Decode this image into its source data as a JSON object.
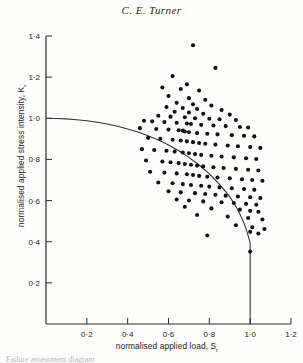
{
  "page": {
    "running_head": "C. E. Turner",
    "footer_fragment": "Failure assessment diagram"
  },
  "axis_labels": {
    "y_main": "normalised applied stress intensity, K",
    "y_sub": "r",
    "x_main": "normalised applied load, S",
    "x_sub": "r"
  },
  "chart_data": {
    "type": "scatter",
    "title": "C. E. Turner",
    "xlabel": "normalised applied load, Sr",
    "ylabel": "normalised applied stress intensity, Kr",
    "xlim": [
      0,
      1.2
    ],
    "ylim": [
      0,
      1.4
    ],
    "xticks": [
      0.2,
      0.4,
      0.6,
      0.8,
      1.0,
      1.2
    ],
    "xtick_labels": [
      "0·2",
      "0·4",
      "0·6",
      "0·8",
      "1·0",
      "1·2"
    ],
    "yticks": [
      0.2,
      0.4,
      0.6,
      0.8,
      1.0,
      1.2,
      1.4
    ],
    "ytick_labels": [
      "0·2",
      "0·4",
      "0·6",
      "0·8",
      "1·0",
      "1·2",
      "1·4"
    ],
    "grid": false,
    "legend": null,
    "marker": "filled-circle",
    "marker_color": "#111111",
    "curve_color": "#333333",
    "series": [
      {
        "name": "failure assessment curve",
        "type": "line",
        "cutoff_sr": 1.0,
        "points": [
          [
            0.0,
            1.0
          ],
          [
            0.05,
            0.999
          ],
          [
            0.1,
            0.997
          ],
          [
            0.15,
            0.993
          ],
          [
            0.2,
            0.988
          ],
          [
            0.25,
            0.981
          ],
          [
            0.3,
            0.972
          ],
          [
            0.35,
            0.961
          ],
          [
            0.4,
            0.948
          ],
          [
            0.45,
            0.933
          ],
          [
            0.5,
            0.915
          ],
          [
            0.55,
            0.894
          ],
          [
            0.6,
            0.87
          ],
          [
            0.65,
            0.842
          ],
          [
            0.7,
            0.81
          ],
          [
            0.75,
            0.773
          ],
          [
            0.8,
            0.73
          ],
          [
            0.85,
            0.679
          ],
          [
            0.88,
            0.644
          ],
          [
            0.9,
            0.618
          ],
          [
            0.92,
            0.588
          ],
          [
            0.94,
            0.554
          ],
          [
            0.96,
            0.513
          ],
          [
            0.97,
            0.489
          ],
          [
            0.98,
            0.462
          ],
          [
            0.99,
            0.43
          ],
          [
            1.0,
            0.392
          ]
        ],
        "vertical_cutoff": {
          "sr": 1.0,
          "kr_from": 0.392,
          "kr_to": 0.0
        }
      },
      {
        "name": "test data",
        "type": "scatter",
        "points": [
          [
            0.72,
            1.355
          ],
          [
            0.83,
            1.245
          ],
          [
            0.62,
            1.205
          ],
          [
            0.69,
            1.165
          ],
          [
            0.57,
            1.15
          ],
          [
            0.66,
            1.142
          ],
          [
            0.75,
            1.135
          ],
          [
            0.6,
            1.108
          ],
          [
            0.7,
            1.098
          ],
          [
            0.78,
            1.09
          ],
          [
            0.64,
            1.075
          ],
          [
            0.72,
            1.068
          ],
          [
            0.81,
            1.062
          ],
          [
            0.59,
            1.055
          ],
          [
            0.67,
            1.05
          ],
          [
            0.74,
            1.045
          ],
          [
            0.86,
            1.04
          ],
          [
            0.63,
            1.032
          ],
          [
            0.7,
            1.028
          ],
          [
            0.77,
            1.022
          ],
          [
            0.9,
            1.018
          ],
          [
            0.55,
            1.012
          ],
          [
            0.61,
            1.008
          ],
          [
            0.68,
            1.005
          ],
          [
            0.73,
            1.0
          ],
          [
            0.8,
            0.998
          ],
          [
            0.85,
            0.995
          ],
          [
            0.93,
            0.992
          ],
          [
            0.48,
            0.988
          ],
          [
            0.52,
            0.985
          ],
          [
            0.58,
            0.982
          ],
          [
            0.64,
            0.978
          ],
          [
            0.69,
            0.975
          ],
          [
            0.71,
            0.972
          ],
          [
            0.76,
            0.968
          ],
          [
            0.82,
            0.965
          ],
          [
            0.88,
            0.962
          ],
          [
            0.95,
            0.958
          ],
          [
            0.99,
            0.955
          ],
          [
            0.46,
            0.952
          ],
          [
            0.54,
            0.948
          ],
          [
            0.6,
            0.945
          ],
          [
            0.65,
            0.942
          ],
          [
            0.67,
            0.94
          ],
          [
            0.68,
            0.936
          ],
          [
            0.7,
            0.932
          ],
          [
            0.74,
            0.928
          ],
          [
            0.79,
            0.925
          ],
          [
            0.84,
            0.922
          ],
          [
            0.91,
            0.918
          ],
          [
            0.97,
            0.915
          ],
          [
            1.02,
            0.912
          ],
          [
            0.5,
            0.905
          ],
          [
            0.56,
            0.9
          ],
          [
            0.62,
            0.896
          ],
          [
            0.66,
            0.892
          ],
          [
            0.69,
            0.888
          ],
          [
            0.72,
            0.884
          ],
          [
            0.75,
            0.88
          ],
          [
            0.78,
            0.876
          ],
          [
            0.83,
            0.872
          ],
          [
            0.89,
            0.868
          ],
          [
            0.94,
            0.864
          ],
          [
            1.0,
            0.86
          ],
          [
            1.05,
            0.856
          ],
          [
            0.47,
            0.85
          ],
          [
            0.53,
            0.846
          ],
          [
            0.59,
            0.842
          ],
          [
            0.63,
            0.838
          ],
          [
            0.67,
            0.834
          ],
          [
            0.7,
            0.83
          ],
          [
            0.73,
            0.826
          ],
          [
            0.76,
            0.822
          ],
          [
            0.81,
            0.818
          ],
          [
            0.86,
            0.814
          ],
          [
            0.92,
            0.81
          ],
          [
            0.98,
            0.806
          ],
          [
            1.03,
            0.802
          ],
          [
            0.49,
            0.795
          ],
          [
            0.57,
            0.79
          ],
          [
            0.61,
            0.786
          ],
          [
            0.65,
            0.782
          ],
          [
            0.68,
            0.778
          ],
          [
            0.71,
            0.774
          ],
          [
            0.74,
            0.77
          ],
          [
            0.77,
            0.766
          ],
          [
            0.82,
            0.762
          ],
          [
            0.87,
            0.758
          ],
          [
            0.93,
            0.754
          ],
          [
            0.99,
            0.75
          ],
          [
            1.04,
            0.746
          ],
          [
            0.51,
            0.74
          ],
          [
            0.58,
            0.736
          ],
          [
            0.64,
            0.732
          ],
          [
            0.69,
            0.728
          ],
          [
            0.72,
            0.724
          ],
          [
            0.75,
            0.72
          ],
          [
            0.79,
            0.716
          ],
          [
            0.84,
            0.712
          ],
          [
            0.9,
            0.708
          ],
          [
            0.96,
            0.704
          ],
          [
            1.01,
            0.7
          ],
          [
            1.06,
            0.696
          ],
          [
            0.55,
            0.688
          ],
          [
            0.62,
            0.684
          ],
          [
            0.67,
            0.68
          ],
          [
            0.71,
            0.676
          ],
          [
            0.76,
            0.672
          ],
          [
            0.8,
            0.668
          ],
          [
            0.85,
            0.664
          ],
          [
            0.91,
            0.66
          ],
          [
            0.97,
            0.656
          ],
          [
            1.02,
            0.652
          ],
          [
            0.6,
            0.645
          ],
          [
            0.66,
            0.64
          ],
          [
            0.73,
            0.636
          ],
          [
            0.78,
            0.632
          ],
          [
            0.83,
            0.628
          ],
          [
            0.88,
            0.624
          ],
          [
            0.94,
            0.62
          ],
          [
            1.0,
            0.616
          ],
          [
            1.05,
            0.612
          ],
          [
            0.64,
            0.605
          ],
          [
            0.7,
            0.6
          ],
          [
            0.77,
            0.596
          ],
          [
            0.86,
            0.592
          ],
          [
            0.92,
            0.588
          ],
          [
            0.98,
            0.584
          ],
          [
            1.03,
            0.58
          ],
          [
            0.68,
            0.57
          ],
          [
            0.81,
            0.562
          ],
          [
            0.95,
            0.556
          ],
          [
            1.0,
            0.55
          ],
          [
            1.04,
            0.546
          ],
          [
            0.74,
            0.53
          ],
          [
            0.89,
            0.522
          ],
          [
            0.99,
            0.515
          ],
          [
            1.06,
            0.508
          ],
          [
            0.93,
            0.48
          ],
          [
            1.01,
            0.47
          ],
          [
            1.07,
            0.462
          ],
          [
            1.0,
            0.448
          ],
          [
            1.04,
            0.44
          ],
          [
            0.79,
            0.43
          ],
          [
            1.0,
            0.352
          ]
        ]
      }
    ]
  }
}
